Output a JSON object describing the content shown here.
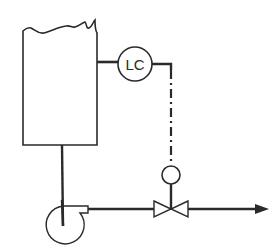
{
  "diagram": {
    "type": "process-control-loop",
    "colors": {
      "line": "#2a2a2a",
      "background": "#ffffff"
    },
    "components": {
      "tank": {
        "label": "",
        "shape": "open-top-vessel"
      },
      "level_controller": {
        "label": "LC",
        "shape": "instrument-bubble"
      },
      "control_valve": {
        "label": "",
        "shape": "globe-valve-with-diaphragm-actuator"
      },
      "pump": {
        "label": "",
        "shape": "centrifugal-pump"
      },
      "outlet_arrow": {
        "label": "",
        "direction": "right"
      }
    },
    "connections": [
      {
        "from": "tank",
        "to": "level_controller",
        "style": "solid-process-tap"
      },
      {
        "from": "level_controller",
        "to": "control_valve",
        "style": "dash-dot-signal"
      },
      {
        "from": "tank",
        "to": "pump",
        "style": "solid-pipe"
      },
      {
        "from": "pump",
        "to": "control_valve",
        "style": "solid-pipe"
      },
      {
        "from": "control_valve",
        "to": "outlet_arrow",
        "style": "solid-pipe"
      }
    ]
  }
}
